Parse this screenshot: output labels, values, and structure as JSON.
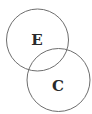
{
  "diagram": {
    "type": "venn",
    "stroke_color": "#6e6e6e",
    "text_color": "#2a2a2a",
    "sets": [
      {
        "label": "E",
        "cx": 37.5,
        "cy": 40,
        "r": 31
      },
      {
        "label": "C",
        "cx": 58.5,
        "cy": 80,
        "r": 31.5
      }
    ]
  }
}
